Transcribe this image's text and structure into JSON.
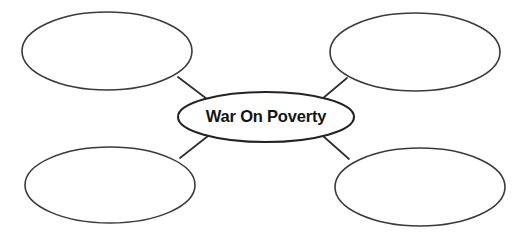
{
  "worksheet": {
    "type": "concept-map",
    "background_color": "#ffffff",
    "line_color": "#2e2e30",
    "text_color": "#141416",
    "center": {
      "label": "War On Poverty",
      "shape": "ellipse",
      "cx": 266,
      "cy": 117,
      "rx": 88,
      "ry": 25
    },
    "branches": [
      {
        "position": "top-left",
        "label": "",
        "shape": "ellipse",
        "cx": 107,
        "cy": 51,
        "rx": 85,
        "ry": 39
      },
      {
        "position": "top-right",
        "label": "",
        "shape": "ellipse",
        "cx": 415,
        "cy": 52,
        "rx": 85,
        "ry": 39
      },
      {
        "position": "bottom-left",
        "label": "",
        "shape": "ellipse",
        "cx": 110,
        "cy": 185,
        "rx": 85,
        "ry": 38
      },
      {
        "position": "bottom-right",
        "label": "",
        "shape": "ellipse",
        "cx": 420,
        "cy": 187,
        "rx": 85,
        "ry": 39
      }
    ],
    "connectors": [
      {
        "from": "top-left",
        "to": "center",
        "x1": 178,
        "y1": 77,
        "x2": 207,
        "y2": 99
      },
      {
        "from": "top-right",
        "to": "center",
        "x1": 347,
        "y1": 78,
        "x2": 322,
        "y2": 99
      },
      {
        "from": "bottom-left",
        "to": "center",
        "x1": 180,
        "y1": 158,
        "x2": 208,
        "y2": 136
      },
      {
        "from": "bottom-right",
        "to": "center",
        "x1": 349,
        "y1": 159,
        "x2": 323,
        "y2": 136
      }
    ]
  }
}
